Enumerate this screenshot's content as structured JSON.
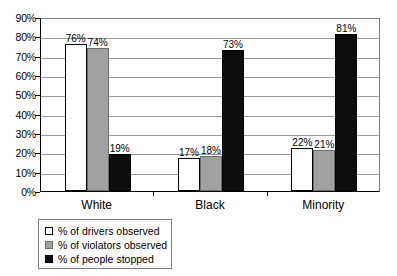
{
  "chart_data": {
    "type": "bar",
    "title": "",
    "subtitle": "",
    "xlabel": "",
    "ylabel": "",
    "categories": [
      "White",
      "Black",
      "Minority"
    ],
    "series": [
      {
        "name": "% of drivers observed",
        "values": [
          76,
          74,
          19
        ],
        "color": "#ffffff"
      },
      {
        "name": "% of violators observed",
        "values": [
          17,
          18,
          73
        ],
        "color": "#a1a1a1"
      },
      {
        "name": "% of people stopped",
        "values": [
          22,
          21,
          81
        ],
        "color": "#0d0d0d"
      }
    ],
    "groups": [
      {
        "category": "White",
        "bars": [
          {
            "series": "% of drivers observed",
            "value": 76,
            "label": "76%",
            "color": "#ffffff"
          },
          {
            "series": "% of violators observed",
            "value": 74,
            "label": "74%",
            "color": "#a1a1a1"
          },
          {
            "series": "% of people stopped",
            "value": 19,
            "label": "19%",
            "color": "#0d0d0d"
          }
        ]
      },
      {
        "category": "Black",
        "bars": [
          {
            "series": "% of drivers observed",
            "value": 17,
            "label": "17%",
            "color": "#ffffff"
          },
          {
            "series": "% of violators observed",
            "value": 18,
            "label": "18%",
            "color": "#a1a1a1"
          },
          {
            "series": "% of people stopped",
            "value": 73,
            "label": "73%",
            "color": "#0d0d0d"
          }
        ]
      },
      {
        "category": "Minority",
        "bars": [
          {
            "series": "% of drivers observed",
            "value": 22,
            "label": "22%",
            "color": "#ffffff"
          },
          {
            "series": "% of violators observed",
            "value": 21,
            "label": "21%",
            "color": "#a1a1a1"
          },
          {
            "series": "% of people stopped",
            "value": 81,
            "label": "81%",
            "color": "#0d0d0d"
          }
        ]
      }
    ],
    "ylim": [
      0,
      90
    ],
    "ytick_values": [
      0,
      10,
      20,
      30,
      40,
      50,
      60,
      70,
      80,
      90
    ],
    "ytick_labels": [
      "0%",
      "10%",
      "20%",
      "30%",
      "40%",
      "50%",
      "60%",
      "70%",
      "80%",
      "90%"
    ],
    "grid": true,
    "grid_axis": "y",
    "legend_position": "bottom-left",
    "legend_entries": [
      "% of drivers observed",
      "% of violators observed",
      "% of people stopped"
    ]
  }
}
